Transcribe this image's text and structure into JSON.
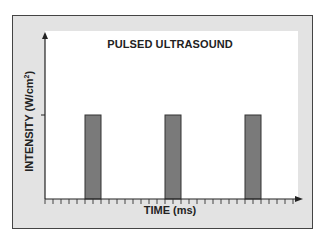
{
  "chart_data": {
    "type": "bar",
    "title": "PULSED ULTRASOUND",
    "xlabel": "TIME (ms)",
    "ylabel": "INTENSITY (W/cm²)",
    "ylabel_base": "INTENSITY (W/cm",
    "ylabel_sup": "2",
    "ylabel_close": ")",
    "x_tick_count": 32,
    "x_ticks_labeled": false,
    "y_ticks_labeled": false,
    "pulses": [
      {
        "start_tick": 5,
        "end_tick": 7,
        "intensity": 1
      },
      {
        "start_tick": 15,
        "end_tick": 17,
        "intensity": 1
      },
      {
        "start_tick": 25,
        "end_tick": 27,
        "intensity": 1
      }
    ],
    "ylim": [
      0,
      1.6
    ],
    "grid": false,
    "legend": null,
    "colors": {
      "bar": "#7a7a7a",
      "bar_edge": "#333333",
      "frame_bg": "#e3e3e3",
      "plot_bg": "#ffffff"
    }
  }
}
